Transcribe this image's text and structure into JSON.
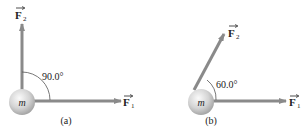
{
  "panels": [
    {
      "id": "a",
      "caption": "(a)",
      "mass_label": "m",
      "angle_label": "90.0°",
      "angle_deg": 90.0,
      "force1": {
        "symbol": "F",
        "subscript": "1"
      },
      "force2": {
        "symbol": "F",
        "subscript": "2"
      }
    },
    {
      "id": "b",
      "caption": "(b)",
      "mass_label": "m",
      "angle_label": "60.0°",
      "angle_deg": 60.0,
      "force1": {
        "symbol": "F",
        "subscript": "1"
      },
      "force2": {
        "symbol": "F",
        "subscript": "2"
      }
    }
  ],
  "colors": {
    "arrow": "#8a8a8a",
    "ball_light": "#f2f2f2",
    "ball_dark": "#a9a9a9",
    "text": "#222222"
  }
}
